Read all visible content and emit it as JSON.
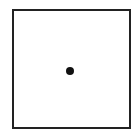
{
  "diagram": {
    "shapes": [
      {
        "type": "square",
        "stroke": "#222222",
        "fill": "#ffffff"
      },
      {
        "type": "dot",
        "position": "center",
        "fill": "#111111"
      }
    ]
  },
  "colors": {
    "background": "#ffffff",
    "stroke": "#222222",
    "dot": "#111111"
  }
}
